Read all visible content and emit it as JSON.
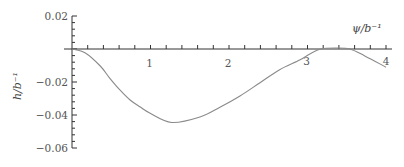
{
  "chart_data": {
    "type": "line",
    "title": "",
    "xlabel": "ψ/b⁻¹",
    "ylabel": "h/b⁻¹",
    "xlim": [
      0,
      4
    ],
    "ylim": [
      -0.06,
      0.02
    ],
    "xticks": [
      1,
      2,
      3,
      4
    ],
    "xtick_labels": [
      "1",
      "2",
      "3",
      "4"
    ],
    "x_minor_tick_step": 0.2,
    "yticks": [
      0.02,
      -0.02,
      -0.04,
      -0.06
    ],
    "ytick_labels": [
      "0.02",
      "−0.02",
      "−0.04",
      "−0.06"
    ],
    "y_minor_tick_step": 0.004,
    "grid": false,
    "legend": null,
    "series": [
      {
        "name": "h(ψ)",
        "color": "#8a8a8a",
        "x": [
          0,
          0.17,
          0.36,
          0.48,
          0.61,
          0.74,
          0.87,
          0.99,
          1.27,
          1.63,
          1.89,
          2.14,
          2.39,
          2.64,
          2.9,
          3.03,
          3.17,
          3.35,
          3.54,
          3.73,
          4.0
        ],
        "y": [
          0,
          -0.0024,
          -0.0103,
          -0.0176,
          -0.0248,
          -0.0309,
          -0.0352,
          -0.0388,
          -0.0445,
          -0.0412,
          -0.0352,
          -0.0285,
          -0.0206,
          -0.0127,
          -0.0067,
          -0.003,
          0,
          0.0006,
          0,
          -0.0042,
          -0.011
        ]
      }
    ]
  },
  "labels": {
    "x_axis": "ψ/b⁻¹",
    "y_axis": "h/b⁻¹"
  }
}
